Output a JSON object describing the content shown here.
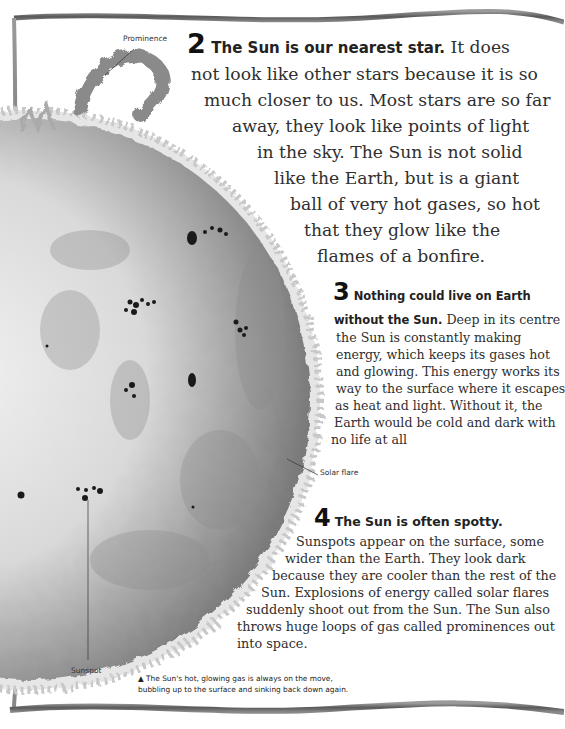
{
  "labels": {
    "prominence": "Prominence",
    "solar_flare": "Solar flare",
    "sunspot": "Sunspot"
  },
  "fact2": {
    "number": "2",
    "heading": "The Sun is our nearest star.",
    "lines": [
      "It does",
      "not look like other stars because it is so",
      "much closer to us. Most stars are so far",
      "away, they look like points of light",
      "in the sky. The Sun is not solid",
      "like the Earth, but is a giant",
      "ball of very hot gases, so hot",
      "that they glow like the",
      "flames of a bonfire."
    ]
  },
  "fact3": {
    "number": "3",
    "heading_line1": "Nothing could live on Earth",
    "heading_line2": "without the Sun.",
    "lines": [
      "Deep in its centre",
      "the Sun is constantly making",
      "energy, which keeps its gases hot",
      "and glowing. This energy works its",
      "way to the surface where it escapes",
      "as heat and light. Without it, the",
      "Earth would be cold and dark with",
      "no life at all"
    ]
  },
  "fact4": {
    "number": "4",
    "heading": "The Sun is often spotty.",
    "lines": [
      "Sunspots appear on the surface, some",
      "wider than the Earth. They look dark",
      "because they are cooler than the rest of the",
      "Sun. Explosions of energy called solar flares",
      "suddenly shoot out from the Sun. The Sun also",
      "throws huge loops of gas called prominences out",
      "into space."
    ]
  },
  "caption": {
    "icon": "▲",
    "line1": "The Sun's hot, glowing gas is always on the move,",
    "line2": "bubbling up to the surface and sinking back down again."
  }
}
